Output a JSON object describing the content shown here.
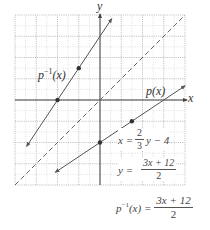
{
  "chart_data": {
    "type": "line",
    "title": "",
    "xlabel": "x",
    "ylabel": "y",
    "xlim": [
      -8,
      8
    ],
    "ylim": [
      -8,
      8
    ],
    "grid": true,
    "grid_major_step": 2,
    "grid_minor_step": 1,
    "series": [
      {
        "name": "p^{-1}(x)",
        "equation": "y = (3x + 12)/2",
        "style": "solid",
        "arrows": "both",
        "x": [
          -6.9,
          1.1
        ],
        "y": [
          -4.35,
          7.65
        ],
        "marked_points": [
          {
            "x": -4,
            "y": 0
          },
          {
            "x": -2,
            "y": 3
          }
        ]
      },
      {
        "name": "p(x)",
        "equation": "y = (2/3)x - 4",
        "style": "solid",
        "arrows": "both",
        "x": [
          -4.2,
          8
        ],
        "y": [
          -6.8,
          1.33
        ],
        "marked_points": [
          {
            "x": 0,
            "y": -4
          },
          {
            "x": 3,
            "y": -2
          }
        ]
      },
      {
        "name": "y = x",
        "equation": "y = x",
        "style": "dashed",
        "x": [
          -8,
          8
        ],
        "y": [
          -8,
          8
        ]
      }
    ],
    "annotations": [
      "p^{-1}(x)",
      "p(x)",
      "x = (2/3)y - 4",
      "y = (3x + 12)/2",
      "p^{-1}(x) = (3x + 12)/2"
    ]
  },
  "labels": {
    "x_axis": "x",
    "y_axis": "y",
    "inverse_curve": "p",
    "inverse_sup": "−1",
    "inverse_arg": "(x)",
    "p_curve": "p(x)",
    "eq1_lhs": "x =",
    "eq1_num": "2",
    "eq1_den": "3",
    "eq1_rhs": "y − 4",
    "eq2_lhs": "y =",
    "eq2_num": "3x + 12",
    "eq2_den": "2",
    "final_p": "p",
    "final_sup": "−1",
    "final_arg": "(x) =",
    "final_num": "3x + 12",
    "final_den": "2"
  },
  "colors": {
    "line": "#555555",
    "grid": "#b5b5b5",
    "axis": "#444444",
    "point": "#333333"
  }
}
